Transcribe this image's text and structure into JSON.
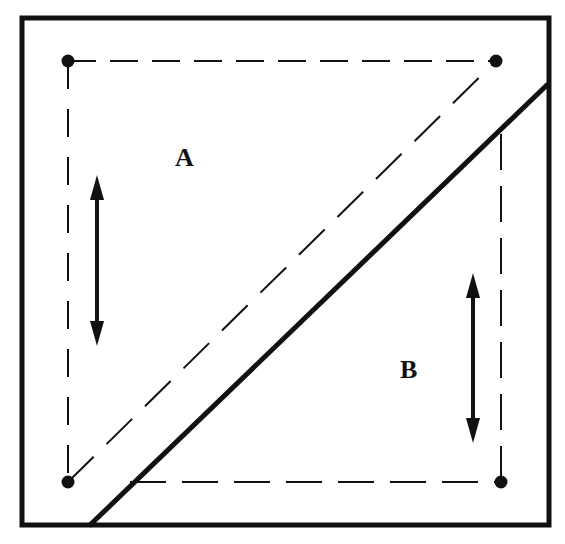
{
  "diagram": {
    "type": "square folding / cutting diagram",
    "colors": {
      "line": "#111111",
      "background": "#ffffff"
    },
    "regions": [
      {
        "id": "A",
        "label": "A",
        "description": "upper-left triangle region above diagonal"
      },
      {
        "id": "B",
        "label": "B",
        "description": "lower-right triangle region below diagonal"
      }
    ],
    "elements": {
      "outer_square": "solid thick border",
      "dashed_square": "dashed inner square with corner dots",
      "dashed_diagonal": "dashed line from bottom-left dot to top-right dot",
      "solid_diagonal": "thick solid line from bottom edge to right edge",
      "arrow_a": "double-headed vertical arrow in region A",
      "arrow_b": "double-headed vertical arrow in region B",
      "corner_dots": 4
    }
  }
}
